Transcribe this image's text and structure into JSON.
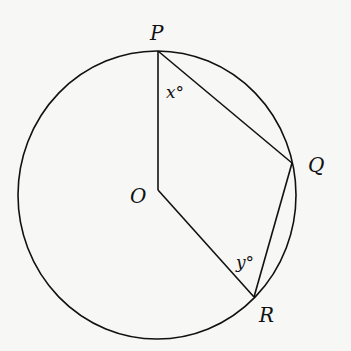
{
  "diagram": {
    "type": "circle-geometry",
    "circle": {
      "center_label": "O"
    },
    "points": {
      "P": {
        "label": "P"
      },
      "Q": {
        "label": "Q"
      },
      "R": {
        "label": "R"
      },
      "O": {
        "label": "O"
      }
    },
    "segments": [
      "OP",
      "PQ",
      "QR",
      "RO"
    ],
    "angles": {
      "x": {
        "label": "x°",
        "at": "P",
        "between": [
          "PO",
          "PQ"
        ]
      },
      "y": {
        "label": "y°",
        "at": "R",
        "between": [
          "RO",
          "RQ"
        ]
      }
    },
    "colors": {
      "stroke": "#111111",
      "background": "#f7f7f5"
    }
  }
}
